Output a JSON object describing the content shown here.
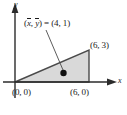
{
  "figure": {
    "name": "centroid-of-triangle-diagram",
    "type": "geometry-diagram",
    "axes": {
      "x_label": "x",
      "y_label": "y",
      "x_arrow": "arrow-right",
      "y_arrow": "arrow-up",
      "origin_px": [
        15,
        82
      ]
    },
    "shape": {
      "kind": "triangle",
      "fill_color": "#d9d9d9",
      "stroke_color": "#4a4a4a",
      "vertices": [
        {
          "label": "(0, 0)",
          "x": 0,
          "y": 0
        },
        {
          "label": "(6, 0)",
          "x": 6,
          "y": 0
        },
        {
          "label": "(6, 3)",
          "x": 6,
          "y": 3
        }
      ]
    },
    "centroid": {
      "label_prefix": "(",
      "x_var": "x",
      "sep": ", ",
      "y_var": "y",
      "label_suffix": ") = (4, 1)",
      "full_label": "(x, y) = (4, 1)",
      "value_x": 4,
      "value_y": 1,
      "marker": "filled-dot",
      "marker_color": "#111111",
      "leader_line": true
    },
    "labels": {
      "vertex_origin": "(0, 0)",
      "vertex_base": "(6, 0)",
      "vertex_top": "(6, 3)",
      "axis_x": "x",
      "axis_y": "y"
    }
  }
}
